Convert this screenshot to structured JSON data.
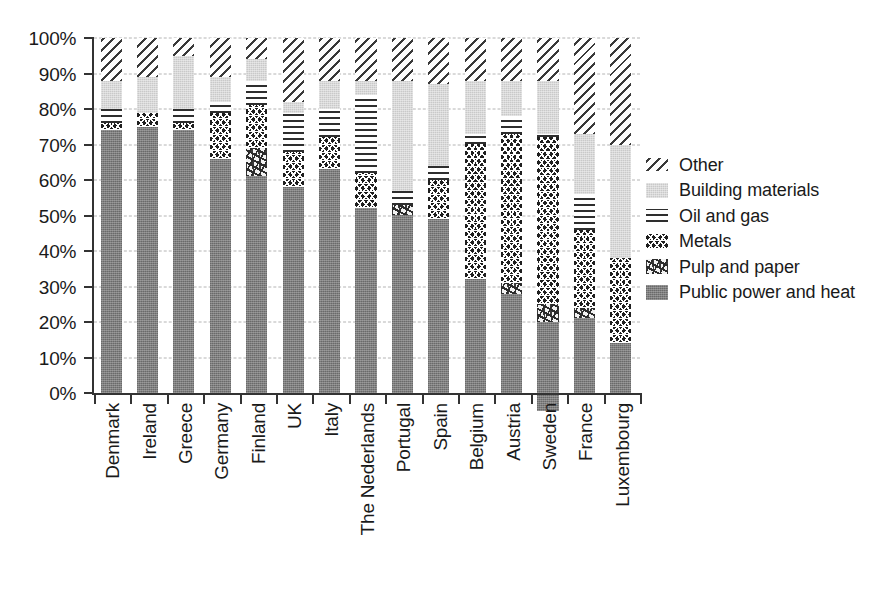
{
  "chart_data": {
    "type": "bar",
    "subtype": "stacked-bar-100-percent",
    "title": "",
    "xlabel": "",
    "ylabel": "",
    "ylim": [
      0,
      100
    ],
    "yticks": [
      "0%",
      "10%",
      "20%",
      "30%",
      "40%",
      "50%",
      "60%",
      "70%",
      "80%",
      "90%",
      "100%"
    ],
    "ytick_values": [
      0,
      10,
      20,
      30,
      40,
      50,
      60,
      70,
      80,
      90,
      100
    ],
    "grid": true,
    "grid_axis": "y",
    "legend_position": "right",
    "stack_order_bottom_to_top": [
      "Public power and heat",
      "Pulp and paper",
      "Metals",
      "Oil and gas",
      "Building materials",
      "Other"
    ],
    "categories": [
      "Denmark",
      "Ireland",
      "Greece",
      "Germany",
      "Finland",
      "UK",
      "Italy",
      "The Nederlands",
      "Portugal",
      "Spain",
      "Belgium",
      "Austria",
      "Sweden",
      "France",
      "Luxembourg"
    ],
    "series": [
      {
        "name": "Public power and heat",
        "pattern": "solid-medium-gray",
        "color": "#7e7e7e",
        "values": [
          74,
          75,
          74,
          66,
          61,
          58,
          63,
          52,
          50,
          49,
          32,
          28,
          25,
          21,
          14
        ]
      },
      {
        "name": "Pulp and paper",
        "pattern": "stipple",
        "color": "#f2f2f2",
        "values": [
          0,
          0,
          0,
          0,
          8,
          0,
          0,
          0,
          3,
          0,
          0,
          3,
          5,
          3,
          0
        ]
      },
      {
        "name": "Metals",
        "pattern": "dense-crosshatch-dark",
        "color": "#1f1f1f",
        "values": [
          2,
          4,
          2,
          13,
          12,
          10,
          9,
          10,
          0,
          11,
          38,
          42,
          47,
          22,
          24
        ]
      },
      {
        "name": "Oil and gas",
        "pattern": "horizontal-lines",
        "color": "#2e2e2e",
        "values": [
          4,
          0,
          4,
          3,
          7,
          11,
          8,
          22,
          4,
          4,
          3,
          5,
          1,
          10,
          0
        ]
      },
      {
        "name": "Building materials",
        "pattern": "solid-light-gray",
        "color": "#c9c9c9",
        "values": [
          8,
          10,
          15,
          7,
          6,
          3,
          8,
          4,
          31,
          23,
          15,
          10,
          15,
          17,
          32
        ]
      },
      {
        "name": "Other",
        "pattern": "diagonal-hatch",
        "color": "#3a3a3a",
        "values": [
          12,
          11,
          5,
          11,
          6,
          18,
          12,
          12,
          12,
          13,
          12,
          12,
          12,
          27,
          30
        ]
      }
    ]
  },
  "legend": {
    "items": [
      {
        "label": "Other",
        "swatch": "f-other"
      },
      {
        "label": "Building materials",
        "swatch": "f-building"
      },
      {
        "label": "Oil and gas",
        "swatch": "f-oilgas"
      },
      {
        "label": "Metals",
        "swatch": "f-metals"
      },
      {
        "label": "Pulp and paper",
        "swatch": "f-pulp"
      },
      {
        "label": "Public power and heat",
        "swatch": "f-public"
      }
    ]
  }
}
